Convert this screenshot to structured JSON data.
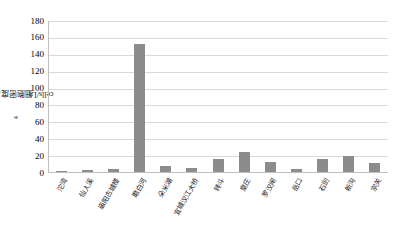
{
  "chart_data": {
    "type": "bar",
    "title": "",
    "xlabel": "",
    "ylabel": "细胞密度/(×10⁴cells/L)",
    "ylabel_base": "细胞密度/(×10",
    "ylabel_sup": "4",
    "ylabel_tail": "cells/L)",
    "ylim": [
      0,
      180
    ],
    "ytick_step": 20,
    "yticks": [
      "180",
      "160",
      "140",
      "120",
      "100",
      "80",
      "60",
      "40",
      "20",
      "0"
    ],
    "grid": true,
    "legend": "none",
    "bar_color": "#8c8c8c",
    "gridline_color": "#d9d9d9",
    "axis_color": "#bfbfbf",
    "categories": [
      "沱湾",
      "仙人溪",
      "庙阳古城楼",
      "磨白河",
      "朵米湖",
      "宜城汉江大桥",
      "转斗",
      "皇庄",
      "罗汉闸",
      "岳口",
      "石剅",
      "新沟",
      "宗关"
    ],
    "values": [
      1,
      2,
      4,
      152,
      7,
      5,
      16,
      24,
      12,
      4,
      16,
      19,
      11
    ]
  }
}
